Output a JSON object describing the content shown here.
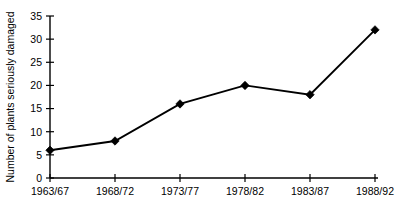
{
  "chart_data": {
    "type": "line",
    "title": "",
    "xlabel": "",
    "ylabel": "Number of plants seriously damaged",
    "categories": [
      "1963/67",
      "1968/72",
      "1973/77",
      "1978/82",
      "1983/87",
      "1988/92"
    ],
    "values": [
      6,
      8,
      16,
      20,
      18,
      32
    ],
    "series": [
      {
        "name": "Plants seriously damaged",
        "values": [
          6,
          8,
          16,
          20,
          18,
          32
        ]
      }
    ],
    "ylim": [
      0,
      35
    ],
    "ytick_labels": [
      "0",
      "5",
      "10",
      "15",
      "20",
      "25",
      "30",
      "35"
    ],
    "ytick_values": [
      0,
      5,
      10,
      15,
      20,
      25,
      30,
      35
    ],
    "grid": false,
    "legend": false,
    "legend_position": "none",
    "marker": "diamond",
    "line_color": "#000000",
    "marker_color": "#000000",
    "background_color": "#ffffff"
  }
}
